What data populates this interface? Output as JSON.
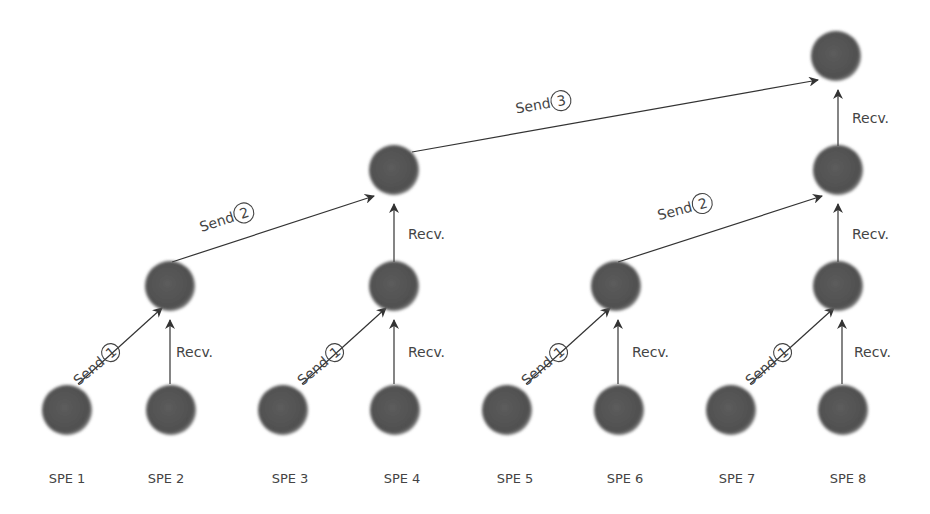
{
  "colors": {
    "node": "#555555",
    "edge": "#333333",
    "text": "#444444"
  },
  "spe_labels": [
    "SPE 1",
    "SPE 2",
    "SPE 3",
    "SPE 4",
    "SPE 5",
    "SPE 6",
    "SPE 7",
    "SPE 8"
  ],
  "send_word": "Send",
  "recv_word": "Recv.",
  "steps": {
    "s1": "1",
    "s2": "2",
    "s3": "3"
  }
}
